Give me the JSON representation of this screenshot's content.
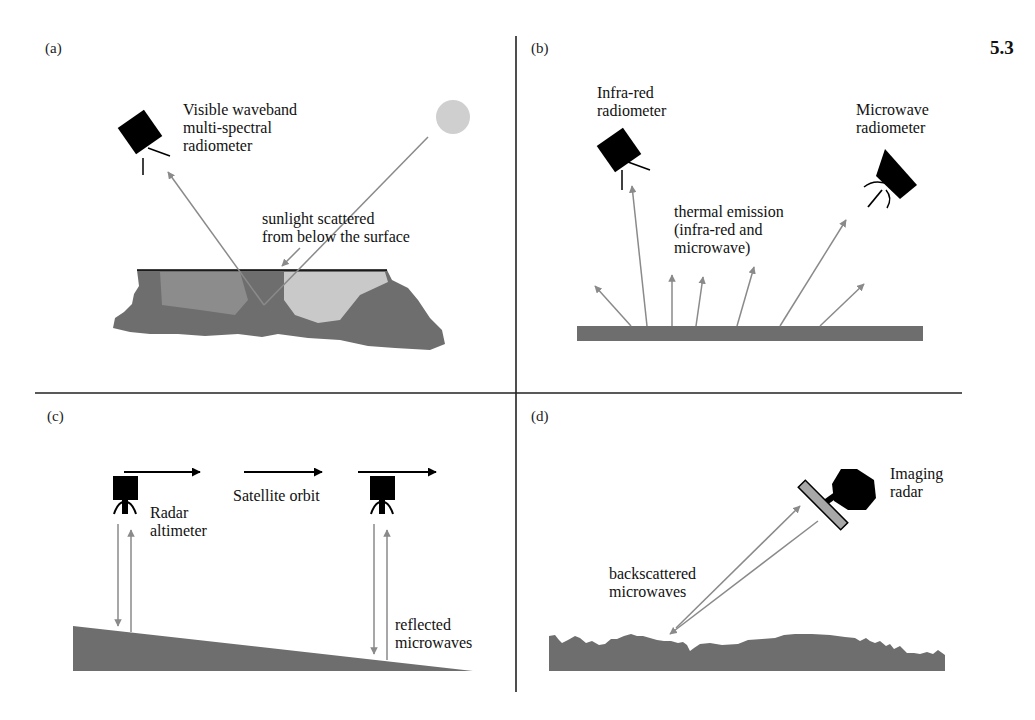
{
  "figure": {
    "number": "5.3",
    "colors": {
      "instrument": "#000000",
      "ground": "#6e6e6e",
      "ray": "#8a8a8a",
      "sun": "#cfcfcf",
      "ice_medium": "#8c8c8c",
      "ice_light": "#c9c9c9",
      "antenna": "#a8a8a8",
      "divider": "#222222"
    }
  },
  "panels": [
    {
      "id": "a",
      "letter": "(a)",
      "labels": {
        "instrument": "Visible waveband\nmulti-spectral\nradiometer",
        "scatter": "sunlight scattered\nfrom below the surface"
      },
      "icons": [
        "radiometer-icon",
        "sun-icon",
        "sea-ice-surface"
      ]
    },
    {
      "id": "b",
      "letter": "(b)",
      "labels": {
        "infrared": "Infra-red\nradiometer",
        "microwave": "Microwave\nradiometer",
        "emission": "thermal emission\n(infra-red and\nmicrowave)"
      },
      "icons": [
        "infrared-radiometer-icon",
        "microwave-radiometer-icon",
        "emitting-surface"
      ]
    },
    {
      "id": "c",
      "letter": "(c)",
      "labels": {
        "instrument": "Radar\naltimeter",
        "orbit": "Satellite orbit",
        "reflected": "reflected\nmicrowaves"
      },
      "icons": [
        "radar-altimeter-icon",
        "orbit-arrow",
        "sloping-surface"
      ]
    },
    {
      "id": "d",
      "letter": "(d)",
      "labels": {
        "instrument": "Imaging\nradar",
        "backscatter": "backscattered\nmicrowaves"
      },
      "icons": [
        "imaging-radar-icon",
        "rough-surface"
      ]
    }
  ]
}
